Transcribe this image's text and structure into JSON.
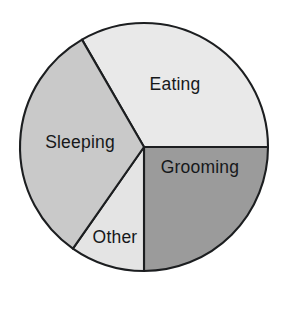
{
  "chart_data": {
    "type": "pie",
    "title": "",
    "xlabel": "",
    "ylabel": "",
    "legend": "none",
    "grid": false,
    "labels_on_slices": true,
    "categories": [
      "Eating",
      "Grooming",
      "Other",
      "Sleeping"
    ],
    "values": [
      33,
      25,
      10,
      32
    ],
    "units": "percent",
    "start_angle_deg": 0,
    "direction": "clockwise",
    "slices": [
      {
        "label": "Eating",
        "value": 33,
        "angle_deg": 120,
        "start_angle_deg": -120,
        "end_angle_deg": 0,
        "color": "#e9e9e9"
      },
      {
        "label": "Grooming",
        "value": 25,
        "angle_deg": 90,
        "start_angle_deg": 0,
        "end_angle_deg": 90,
        "color": "#9b9b9b"
      },
      {
        "label": "Other",
        "value": 10,
        "angle_deg": 35,
        "start_angle_deg": 90,
        "end_angle_deg": 125,
        "color": "#e4e4e4"
      },
      {
        "label": "Sleeping",
        "value": 32,
        "angle_deg": 115,
        "start_angle_deg": 125,
        "end_angle_deg": 240,
        "color": "#c9c9c9"
      }
    ],
    "geometry": {
      "center_x": 144,
      "center_y": 147,
      "radius": 124
    },
    "label_positions": [
      {
        "label": "Eating",
        "x": 175,
        "y": 90
      },
      {
        "label": "Grooming",
        "x": 200,
        "y": 173
      },
      {
        "label": "Other",
        "x": 115,
        "y": 243
      },
      {
        "label": "Sleeping",
        "x": 80,
        "y": 148
      }
    ],
    "colors": {
      "outline": "#1c1e20",
      "background": "#ffffff",
      "text": "#16181a"
    }
  }
}
